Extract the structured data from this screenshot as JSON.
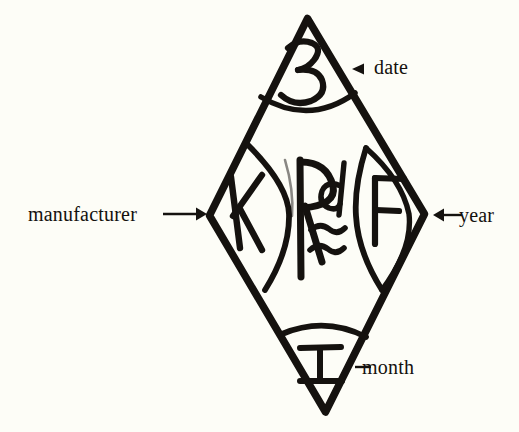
{
  "figure": {
    "kind": "hand-drawn-hallmark-diagram",
    "background_color": "#fdfdf7",
    "ink_color": "#15120f",
    "outline": {
      "shape": "diamond",
      "vertices": {
        "top": [
          307,
          18
        ],
        "right": [
          425,
          215
        ],
        "bottom": [
          325,
          413
        ],
        "left": [
          209,
          215
        ]
      }
    },
    "compartments": [
      {
        "id": "top",
        "position": "top",
        "mark": "3",
        "meaning": "date",
        "divider": "arc"
      },
      {
        "id": "left",
        "position": "left",
        "mark": "K",
        "meaning": "manufacturer",
        "divider": "lens"
      },
      {
        "id": "center",
        "position": "center",
        "mark": "Rd",
        "sub_mark": "≈",
        "meaning": "registered design",
        "divider": "none"
      },
      {
        "id": "right",
        "position": "right",
        "mark": "F",
        "meaning": "year",
        "divider": "lens"
      },
      {
        "id": "bottom",
        "position": "bottom",
        "mark": "I",
        "meaning": "month",
        "divider": "arc"
      }
    ]
  },
  "callouts": {
    "manufacturer": {
      "text": "manufacturer",
      "connector": "arrow-right",
      "points_to": "left"
    },
    "date": {
      "text": "date",
      "connector": "arrowhead-left",
      "points_to": "top"
    },
    "year": {
      "text": "year",
      "connector": "arrow-left",
      "points_to": "right"
    },
    "month": {
      "text": "month",
      "connector": "dash",
      "points_to": "bottom"
    }
  }
}
